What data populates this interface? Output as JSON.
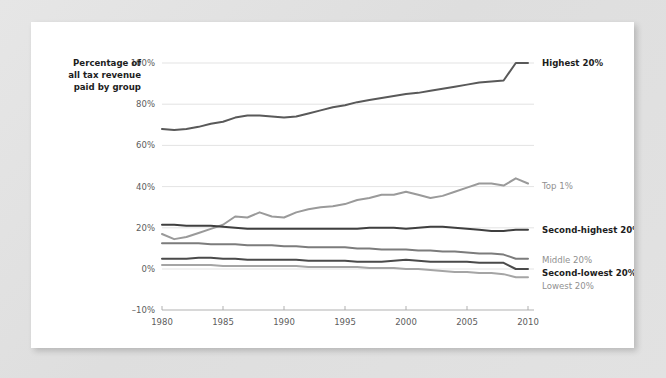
{
  "card": {
    "background_color": "#ffffff",
    "page_background_color": "#e3e3e3"
  },
  "axis_title": {
    "line1": "Percentage of",
    "line2": "all tax revenue",
    "line3": "paid by group"
  },
  "series_labels": {
    "highest20": "Highest 20%",
    "top1": "Top 1%",
    "secondhighest20": "Second-highest 20%",
    "middle20": "Middle 20%",
    "secondlowest20": "Second-lowest 20%",
    "lowest20": "Lowest 20%"
  },
  "chart_data": {
    "type": "line",
    "title": "",
    "subtitle": "",
    "xlabel": "",
    "ylabel": "Percentage of all tax revenue paid by group",
    "xlim": [
      1980,
      2010
    ],
    "ylim": [
      -10,
      100
    ],
    "grid": true,
    "legend_position": "right-inline",
    "x_ticks": [
      1980,
      1985,
      1990,
      1995,
      2000,
      2005,
      2010
    ],
    "x_tick_labels": [
      "1980",
      "1985",
      "1990",
      "1995",
      "2000",
      "2005",
      "2010"
    ],
    "y_ticks": [
      -10,
      0,
      20,
      40,
      60,
      80,
      100
    ],
    "y_tick_labels": [
      "–10%",
      "0%",
      "20%",
      "40%",
      "60%",
      "80%",
      "100%"
    ],
    "x": [
      1980,
      1981,
      1982,
      1983,
      1984,
      1985,
      1986,
      1987,
      1988,
      1989,
      1990,
      1991,
      1992,
      1993,
      1994,
      1995,
      1996,
      1997,
      1998,
      1999,
      2000,
      2001,
      2002,
      2003,
      2004,
      2005,
      2006,
      2007,
      2008,
      2009,
      2010
    ],
    "series": [
      {
        "name": "Highest 20%",
        "color": "#595959",
        "label_color": "#1d1d1d",
        "label_bold": true,
        "values": [
          68,
          67.5,
          68,
          69,
          70.5,
          71.5,
          73.5,
          74.5,
          74.5,
          74,
          73.5,
          74,
          75.5,
          77,
          78.5,
          79.5,
          81,
          82,
          83,
          84,
          85,
          85.5,
          86.5,
          87.5,
          88.5,
          89.5,
          90.5,
          91,
          91.5,
          100,
          100
        ]
      },
      {
        "name": "Top 1%",
        "color": "#9a9a9a",
        "label_color": "#909090",
        "label_bold": false,
        "values": [
          17,
          14.5,
          15.5,
          17.5,
          19.5,
          21.5,
          25.5,
          25,
          27.5,
          25.5,
          25,
          27.5,
          29,
          30,
          30.5,
          31.5,
          33.5,
          34.5,
          36,
          36,
          37.5,
          36,
          34.5,
          35.5,
          37.5,
          39.5,
          41.5,
          41.5,
          40.5,
          44,
          41.5
        ]
      },
      {
        "name": "Second-highest 20%",
        "color": "#3f3f3f",
        "label_color": "#1d1d1d",
        "label_bold": true,
        "values": [
          21.5,
          21.5,
          21,
          21,
          21,
          20.5,
          20,
          19.5,
          19.5,
          19.5,
          19.5,
          19.5,
          19.5,
          19.5,
          19.5,
          19.5,
          19.5,
          20,
          20,
          20,
          19.5,
          20,
          20.5,
          20.5,
          20,
          19.5,
          19,
          18.5,
          18.5,
          19,
          19
        ]
      },
      {
        "name": "Middle 20%",
        "color": "#7c7c7c",
        "label_color": "#6f6f6f",
        "label_bold": false,
        "values": [
          12.5,
          12.5,
          12.5,
          12.5,
          12,
          12,
          12,
          11.5,
          11.5,
          11.5,
          11,
          11,
          10.5,
          10.5,
          10.5,
          10.5,
          10,
          10,
          9.5,
          9.5,
          9.5,
          9,
          9,
          8.5,
          8.5,
          8,
          7.5,
          7.5,
          7,
          5,
          5
        ]
      },
      {
        "name": "Second-lowest 20%",
        "color": "#4a4a4a",
        "label_color": "#1d1d1d",
        "label_bold": true,
        "values": [
          5,
          5,
          5,
          5.5,
          5.5,
          5,
          5,
          4.5,
          4.5,
          4.5,
          4.5,
          4.5,
          4,
          4,
          4,
          4,
          3.5,
          3.5,
          3.5,
          4,
          4.5,
          4,
          3.5,
          3.5,
          3.5,
          3.5,
          3,
          3,
          3,
          0,
          0
        ]
      },
      {
        "name": "Lowest 20%",
        "color": "#a5a5a5",
        "label_color": "#909090",
        "label_bold": false,
        "values": [
          2,
          2,
          2,
          2,
          2,
          1.5,
          1.5,
          1.5,
          1.5,
          1.5,
          1.5,
          1.5,
          1,
          1,
          1,
          1,
          1,
          0.5,
          0.5,
          0.5,
          0,
          0,
          -0.5,
          -1,
          -1.5,
          -1.5,
          -2,
          -2,
          -2.5,
          -4,
          -4
        ]
      }
    ]
  }
}
